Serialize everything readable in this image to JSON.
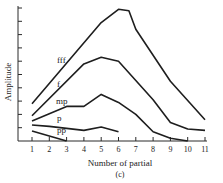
{
  "chart_data": {
    "type": "line",
    "title": "",
    "caption": "(c)",
    "xlabel": "Number of partial",
    "ylabel": "Amplitude",
    "x_ticks": [
      1,
      2,
      3,
      4,
      5,
      6,
      7,
      8,
      9,
      10,
      11
    ],
    "xlim": [
      0,
      11
    ],
    "ylim": [
      0,
      10
    ],
    "y_tick_count": 10,
    "y_tick_labels": [],
    "grid": false,
    "legend": "inline labels",
    "series": [
      {
        "name": "fff",
        "x": [
          1,
          5,
          6,
          6.6,
          7,
          9,
          11
        ],
        "values": [
          2.8,
          8.9,
          9.9,
          9.8,
          8.4,
          4.5,
          1.6
        ]
      },
      {
        "name": "f",
        "x": [
          1,
          4,
          5,
          6,
          8,
          9,
          10,
          11
        ],
        "values": [
          1.9,
          5.8,
          6.3,
          6.0,
          3.1,
          1.4,
          0.9,
          0.8
        ]
      },
      {
        "name": "mp",
        "x": [
          1,
          3,
          4,
          5,
          6,
          7,
          8,
          9,
          10
        ],
        "values": [
          1.5,
          2.6,
          2.6,
          3.5,
          2.9,
          2.0,
          0.7,
          0.2,
          0.0
        ]
      },
      {
        "name": "p",
        "x": [
          1,
          2,
          4,
          5,
          6
        ],
        "values": [
          1.2,
          1.1,
          0.8,
          1.05,
          0.7
        ]
      },
      {
        "name": "pp",
        "x": [
          1,
          3
        ],
        "values": [
          0.75,
          0.0
        ]
      }
    ]
  }
}
